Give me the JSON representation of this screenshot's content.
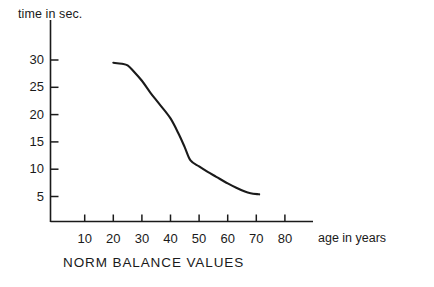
{
  "chart_data": {
    "type": "line",
    "title": "NORM BALANCE VALUES",
    "xlabel": "age in years",
    "ylabel": "time in sec.",
    "xlim": [
      0,
      90
    ],
    "ylim": [
      0,
      33
    ],
    "xticks": [
      10,
      20,
      30,
      40,
      50,
      60,
      70,
      80
    ],
    "xtick_labels": [
      "10",
      "20",
      "30",
      "40",
      "50",
      "60",
      "70",
      "80"
    ],
    "yticks": [
      5,
      10,
      15,
      20,
      25,
      30
    ],
    "ytick_labels": [
      "5",
      "10",
      "15",
      "20",
      "25",
      "30"
    ],
    "grid": false,
    "legend": "none",
    "series": [
      {
        "name": "norm balance time",
        "color": "#1a1a1a",
        "x": [
          20,
          23,
          25,
          27,
          30,
          33,
          36,
          40,
          43,
          45,
          47,
          50,
          53,
          56,
          60,
          63,
          66,
          68,
          71
        ],
        "y": [
          29.5,
          29.3,
          29.0,
          28.0,
          26.2,
          24.0,
          22.0,
          19.3,
          16.3,
          14.0,
          11.6,
          10.5,
          9.5,
          8.6,
          7.4,
          6.6,
          5.9,
          5.6,
          5.4
        ]
      }
    ],
    "annotations": []
  },
  "labels": {
    "y_axis_title": "time in sec.",
    "x_axis_title": "age in years",
    "caption": "NORM BALANCE VALUES"
  },
  "style": {
    "axis_color": "#1a1a1a",
    "line_color": "#1a1a1a",
    "background": "#ffffff"
  }
}
